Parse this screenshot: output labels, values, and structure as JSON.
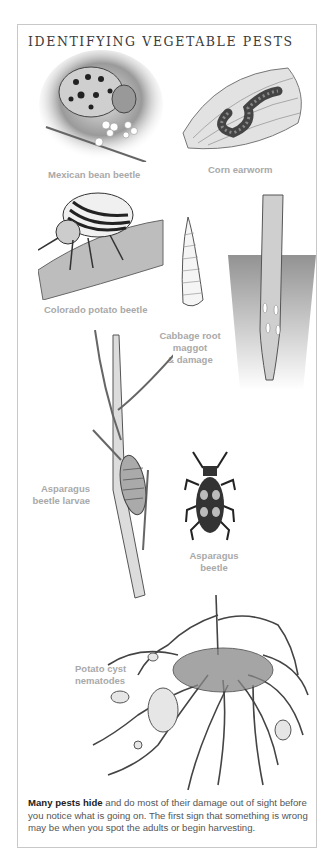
{
  "page": {
    "title": "IDENTIFYING VEGETABLE PESTS",
    "colors": {
      "border": "#c8c8c8",
      "title": "#3a3a3a",
      "label": "#a9a9a9",
      "body_text": "#555555",
      "bold_text": "#222222"
    }
  },
  "illustrations": [
    {
      "name": "Mexican bean beetle",
      "icon": "mexican-bean-beetle-illustration"
    },
    {
      "name": "Corn earworm",
      "icon": "corn-earworm-illustration"
    },
    {
      "name": "Colorado potato beetle",
      "icon": "colorado-potato-beetle-illustration"
    },
    {
      "name": "Cabbage root maggot & damage",
      "icon": "cabbage-root-maggot-illustration"
    },
    {
      "name": "Asparagus beetle larvae",
      "icon": "asparagus-beetle-larvae-illustration"
    },
    {
      "name": "Asparagus beetle",
      "icon": "asparagus-beetle-illustration"
    },
    {
      "name": "Potato cyst nematodes",
      "icon": "potato-cyst-nematodes-illustration"
    }
  ],
  "labels": {
    "mexican": "Mexican bean beetle",
    "corn": "Corn earworm",
    "colorado": "Colorado potato beetle",
    "cabbage_1": "Cabbage root",
    "cabbage_2": "maggot",
    "cabbage_3": "& damage",
    "asp_larvae_1": "Asparagus",
    "asp_larvae_2": "beetle larvae",
    "asp_beetle_1": "Asparagus",
    "asp_beetle_2": "beetle",
    "potato_1": "Potato cyst",
    "potato_2": "nematodes"
  },
  "caption": {
    "bold": "Many pests hide",
    "text": " and do most of their damage out of sight before you notice what is going on. The first sign that something is wrong may be when you spot the adults or begin harvesting."
  }
}
